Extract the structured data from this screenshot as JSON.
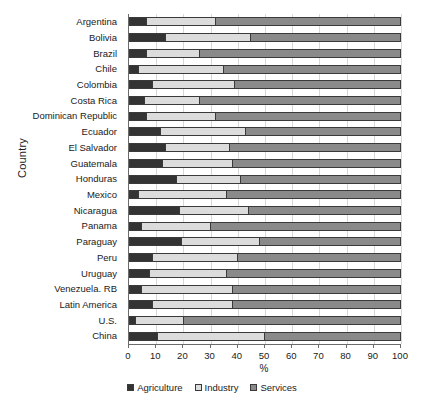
{
  "chart_data": {
    "type": "bar",
    "orientation": "horizontal",
    "stacked": true,
    "title": "",
    "xlabel": "%",
    "ylabel": "Country",
    "xlim": [
      0,
      100
    ],
    "grid": true,
    "legend_position": "bottom",
    "xticks": [
      0,
      10,
      20,
      30,
      40,
      50,
      60,
      70,
      80,
      90,
      100
    ],
    "xtick_labels": [
      "0",
      "10",
      "20",
      "30",
      "40",
      "50",
      "60",
      "70",
      "80",
      "90",
      "100"
    ],
    "categories": [
      "Argentina",
      "Bolivia",
      "Brazil",
      "Chile",
      "Colombia",
      "Costa Rica",
      "Dominican Republic",
      "Ecuador",
      "El Salvador",
      "Guatemala",
      "Honduras",
      "Mexico",
      "Nicaragua",
      "Panama",
      "Paraguay",
      "Peru",
      "Uruguay",
      "Venezuela. RB",
      "Latin America",
      "U.S.",
      "China"
    ],
    "series": [
      {
        "name": "Agriculture",
        "color": "#333333",
        "values": [
          6,
          13,
          6,
          3,
          8,
          5,
          6,
          11,
          13,
          12,
          17,
          3,
          18,
          4,
          19,
          8,
          7,
          4,
          8,
          2,
          10
        ]
      },
      {
        "name": "Industry",
        "color": "#dcdcdc",
        "values": [
          26,
          32,
          20,
          32,
          31,
          21,
          26,
          32,
          24,
          26,
          24,
          33,
          26,
          26,
          29,
          32,
          29,
          34,
          30,
          18,
          40
        ]
      },
      {
        "name": "Services",
        "color": "#8a8a8a",
        "values": [
          68,
          55,
          74,
          65,
          61,
          74,
          68,
          57,
          63,
          62,
          59,
          64,
          56,
          70,
          52,
          60,
          64,
          62,
          62,
          80,
          50
        ]
      }
    ]
  },
  "legend": {
    "items": [
      {
        "label": "Agriculture",
        "color": "#333333"
      },
      {
        "label": "Industry",
        "color": "#dcdcdc"
      },
      {
        "label": "Services",
        "color": "#8a8a8a"
      }
    ]
  }
}
